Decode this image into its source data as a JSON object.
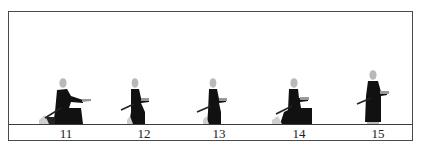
{
  "diagram": {
    "type": "sequence-illustration",
    "frames": [
      {
        "label": "11",
        "pose": "kneeling-seated, arms extended forward"
      },
      {
        "label": "12",
        "pose": "crouching on one knee, hands at chest"
      },
      {
        "label": "13",
        "pose": "rising on one knee, hands at chest"
      },
      {
        "label": "14",
        "pose": "kneeling-seated, hands at chest"
      },
      {
        "label": "15",
        "pose": "standing upright, hands at chest"
      }
    ]
  },
  "colors": {
    "figure": "#111111",
    "head": "#b8b8b8",
    "border": "#4a4a4a",
    "background": "#ffffff"
  }
}
